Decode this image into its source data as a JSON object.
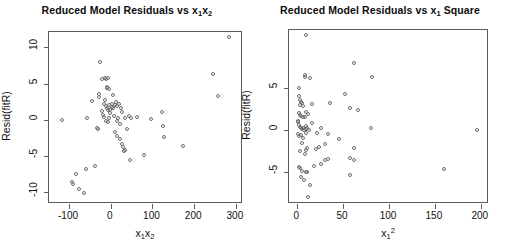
{
  "figure": {
    "width": 507,
    "height": 244,
    "background": "#ffffff",
    "point_color": "#6e6e6e",
    "axis_color": "#5b5b5b"
  },
  "chart_data": [
    {
      "type": "scatter",
      "panel": "left",
      "title": "Reduced Model Residuals vs x1x2",
      "title_parts": {
        "prefix": "Reduced Model Residuals vs ",
        "var1": "x",
        "sub1": "1",
        "var2": "x",
        "sub2": "2"
      },
      "xlabel": "x1x2",
      "xlabel_parts": {
        "v1": "x",
        "s1": "1",
        "v2": "x",
        "s2": "2"
      },
      "ylabel": "Resid(fitR)",
      "xlim": [
        -148,
        317
      ],
      "ylim": [
        -11.6,
        12.1
      ],
      "xticks": [
        -100,
        0,
        100,
        200,
        300
      ],
      "xtick_labels": [
        "-100",
        "0",
        "100",
        "200",
        "300"
      ],
      "yticks": [
        10,
        5,
        0,
        -5,
        -10
      ],
      "ytick_labels": [
        "10",
        "5",
        "0",
        "-5",
        "-10"
      ],
      "grid": false,
      "legend": "none",
      "points": [
        [
          284,
          11.4
        ],
        [
          -118,
          0.0
        ],
        [
          -83,
          -7.4
        ],
        [
          -92,
          -8.5
        ],
        [
          -90,
          -8.8
        ],
        [
          -77,
          -9.5
        ],
        [
          -64,
          -10.1
        ],
        [
          -60,
          -6.8
        ],
        [
          -38,
          -6.4
        ],
        [
          -57,
          0.2
        ],
        [
          -44,
          2.6
        ],
        [
          -34,
          -1.1
        ],
        [
          -30,
          -1.2
        ],
        [
          -27,
          3.2
        ],
        [
          -28,
          3.5
        ],
        [
          -25,
          8.0
        ],
        [
          -20,
          5.6
        ],
        [
          -13,
          5.7
        ],
        [
          -11,
          5.6
        ],
        [
          -7,
          5.8
        ],
        [
          -10,
          4.5
        ],
        [
          -8,
          4.4
        ],
        [
          -5,
          4.3
        ],
        [
          -14,
          2.7
        ],
        [
          -16,
          2.2
        ],
        [
          -12,
          1.9
        ],
        [
          -9,
          1.6
        ],
        [
          -6,
          1.3
        ],
        [
          -4,
          2.1
        ],
        [
          -2,
          1.4
        ],
        [
          -18,
          0.6
        ],
        [
          -15,
          0.4
        ],
        [
          -11,
          -0.1
        ],
        [
          -6,
          -0.3
        ],
        [
          -3,
          0.2
        ],
        [
          -1,
          0.9
        ],
        [
          2,
          1.8
        ],
        [
          4,
          2.2
        ],
        [
          6,
          1.6
        ],
        [
          9,
          2.0
        ],
        [
          12,
          2.5
        ],
        [
          16,
          1.9
        ],
        [
          20,
          2.2
        ],
        [
          24,
          1.6
        ],
        [
          8,
          0.5
        ],
        [
          14,
          -0.2
        ],
        [
          18,
          0.3
        ],
        [
          22,
          -0.6
        ],
        [
          10,
          -1.7
        ],
        [
          15,
          -2.2
        ],
        [
          21,
          -2.6
        ],
        [
          26,
          -3.3
        ],
        [
          29,
          -3.8
        ],
        [
          31,
          -4.3
        ],
        [
          33,
          -4.2
        ],
        [
          40,
          -1.2
        ],
        [
          44,
          0.5
        ],
        [
          48,
          0.2
        ],
        [
          46,
          -5.5
        ],
        [
          62,
          0.4
        ],
        [
          80,
          -4.8
        ],
        [
          96,
          0.1
        ],
        [
          124,
          1.1
        ],
        [
          126,
          -0.8
        ],
        [
          128,
          -2.4
        ],
        [
          172,
          -3.6
        ],
        [
          246,
          6.3
        ],
        [
          258,
          3.3
        ],
        [
          34,
          0.3
        ],
        [
          28,
          1.1
        ],
        [
          5,
          3.4
        ],
        [
          -21,
          1.2
        ]
      ]
    },
    {
      "type": "scatter",
      "panel": "right",
      "title": "Reduced Model Residuals vs x1 Square",
      "title_parts": {
        "prefix": "Reduced Model Residuals vs ",
        "var1": "x",
        "sub1": "1",
        "suffix": " Square"
      },
      "xlabel": "x1^2",
      "xlabel_parts": {
        "v1": "x",
        "s1": "1",
        "p1": "2"
      },
      "ylabel": "Resid(fitR)",
      "xlim": [
        -9,
        209
      ],
      "ylim": [
        -8.8,
        11.9
      ],
      "xticks": [
        0,
        50,
        100,
        150,
        200
      ],
      "xtick_labels": [
        "0",
        "50",
        "100",
        "150",
        "200"
      ],
      "yticks": [
        5,
        0,
        -5
      ],
      "ytick_labels": [
        "5",
        "0",
        "-5"
      ],
      "grid": false,
      "legend": "none",
      "points": [
        [
          10,
          11.3
        ],
        [
          62,
          8.0
        ],
        [
          8,
          6.6
        ],
        [
          8,
          6.3
        ],
        [
          14,
          6.2
        ],
        [
          82,
          6.3
        ],
        [
          2,
          5.0
        ],
        [
          2,
          4.1
        ],
        [
          3,
          3.6
        ],
        [
          4,
          3.3
        ],
        [
          5,
          3.2
        ],
        [
          3,
          3.0
        ],
        [
          6,
          2.9
        ],
        [
          16,
          3.1
        ],
        [
          36,
          3.2
        ],
        [
          58,
          2.6
        ],
        [
          66,
          2.4
        ],
        [
          2,
          2.0
        ],
        [
          3,
          1.8
        ],
        [
          4,
          1.7
        ],
        [
          6,
          1.6
        ],
        [
          8,
          1.5
        ],
        [
          1,
          1.1
        ],
        [
          9,
          2.2
        ],
        [
          12,
          1.9
        ],
        [
          52,
          4.3
        ],
        [
          196,
          0.0
        ],
        [
          1,
          0.9
        ],
        [
          2,
          0.6
        ],
        [
          3,
          0.4
        ],
        [
          4,
          0.2
        ],
        [
          5,
          0.1
        ],
        [
          6,
          0.3
        ],
        [
          7,
          0.0
        ],
        [
          9,
          0.1
        ],
        [
          10,
          0.5
        ],
        [
          11,
          0.2
        ],
        [
          13,
          0.0
        ],
        [
          16,
          0.8
        ],
        [
          22,
          -0.4
        ],
        [
          26,
          0.2
        ],
        [
          34,
          -0.5
        ],
        [
          46,
          -1.1
        ],
        [
          80,
          0.3
        ],
        [
          1,
          -0.5
        ],
        [
          2,
          -0.7
        ],
        [
          4,
          -0.6
        ],
        [
          6,
          -0.9
        ],
        [
          9,
          -0.4
        ],
        [
          5,
          -1.6
        ],
        [
          11,
          -2.1
        ],
        [
          24,
          -2.0
        ],
        [
          30,
          -1.7
        ],
        [
          62,
          -2.1
        ],
        [
          3,
          -2.5
        ],
        [
          8,
          -2.9
        ],
        [
          10,
          -2.4
        ],
        [
          20,
          -2.3
        ],
        [
          57,
          -3.3
        ],
        [
          30,
          -3.6
        ],
        [
          33,
          -3.5
        ],
        [
          62,
          -3.6
        ],
        [
          2,
          -4.4
        ],
        [
          3,
          -4.5
        ],
        [
          26,
          -4.1
        ],
        [
          5,
          -4.9
        ],
        [
          9,
          -5.0
        ],
        [
          11,
          -5.0
        ],
        [
          160,
          -4.6
        ],
        [
          4,
          -5.6
        ],
        [
          57,
          -5.3
        ],
        [
          14,
          -6.5
        ],
        [
          12,
          -8.0
        ],
        [
          7,
          -5.9
        ],
        [
          18,
          -4.3
        ]
      ]
    }
  ]
}
